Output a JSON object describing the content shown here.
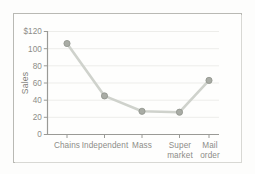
{
  "figure": {
    "background_color": "#fdfdfc",
    "frame_color": "#b9b9b4",
    "plot_background_color": "#fefefd"
  },
  "chart_data": {
    "type": "line",
    "title": "",
    "subtitle": "",
    "xlabel": "",
    "ylabel": "Sales",
    "categories": [
      "Chains",
      "Independent",
      "Mass",
      "Super market",
      "Mail order"
    ],
    "category_lines": [
      [
        "Chains"
      ],
      [
        "Independent"
      ],
      [
        "Mass"
      ],
      [
        "Super",
        "market"
      ],
      [
        "Mail",
        "order"
      ]
    ],
    "values": [
      106,
      45,
      27,
      26,
      63
    ],
    "series": [
      {
        "name": "Sales",
        "values": [
          106,
          45,
          27,
          26,
          63
        ],
        "line_color": "#cfd2cc",
        "marker_color": "#a9aca5",
        "marker_edge_color": "#8f938b"
      }
    ],
    "ylim": [
      0,
      120
    ],
    "ytick_values": [
      0,
      20,
      40,
      60,
      80,
      100,
      120
    ],
    "ytick_labels": [
      "0",
      "20",
      "40",
      "60",
      "80",
      "100",
      "$120"
    ],
    "grid": true,
    "grid_axis": "y",
    "grid_color": "#ededea",
    "legend": false,
    "legend_position": "none",
    "axis_color": "#9a9a96",
    "tick_color": "#9a9a96",
    "annotations": []
  },
  "axis": {
    "y_title": "Sales",
    "y_ticks": [
      {
        "label": "$120",
        "value": 120
      },
      {
        "label": "100",
        "value": 100
      },
      {
        "label": "80",
        "value": 80
      },
      {
        "label": "60",
        "value": 60
      },
      {
        "label": "40",
        "value": 40
      },
      {
        "label": "20",
        "value": 20
      },
      {
        "label": "0",
        "value": 0
      }
    ],
    "x_ticks": [
      {
        "line1": "Chains",
        "line2": ""
      },
      {
        "line1": "Independent",
        "line2": ""
      },
      {
        "line1": "Mass",
        "line2": ""
      },
      {
        "line1": "Super",
        "line2": "market"
      },
      {
        "line1": "Mail",
        "line2": "order"
      }
    ]
  }
}
